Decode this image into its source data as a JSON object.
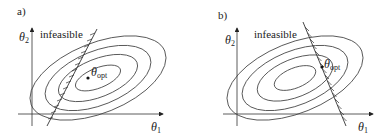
{
  "panels": [
    {
      "id": "a",
      "label": "a)",
      "region_label": "infeasible",
      "y_axis": {
        "symbol": "θ",
        "subscript": "2"
      },
      "x_axis": {
        "symbol": "θ",
        "subscript": "1"
      },
      "optimum": {
        "symbol": "θ",
        "subscript": "opt",
        "location": "interior (unconstrained optimum lies in feasible region)"
      },
      "constraint": {
        "hatch_side": "left",
        "slope": "positive"
      },
      "contour_count": 4
    },
    {
      "id": "b",
      "label": "b)",
      "region_label": "infeasible",
      "y_axis": {
        "symbol": "θ",
        "subscript": "2"
      },
      "x_axis": {
        "symbol": "θ",
        "subscript": "1"
      },
      "optimum": {
        "symbol": "θ",
        "subscript": "opt",
        "location": "on constraint boundary"
      },
      "constraint": {
        "hatch_side": "right",
        "slope": "negative"
      },
      "contour_count": 4
    }
  ],
  "colors": {
    "stroke": "#333333",
    "text": "#222222",
    "background": "#ffffff"
  }
}
